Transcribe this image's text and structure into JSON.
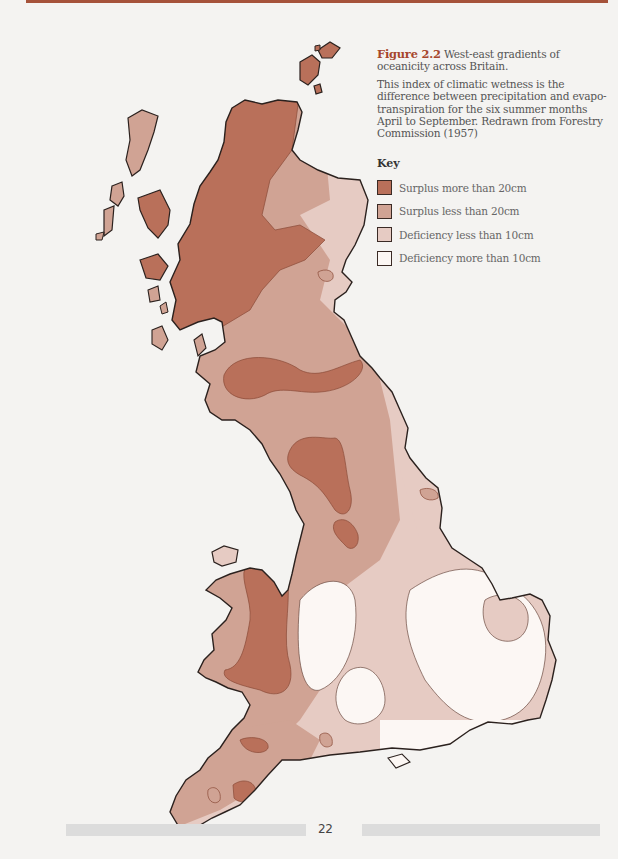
{
  "figure": {
    "label": "Figure 2.2",
    "title": "West-east gradients of oceanicity across Britain.",
    "description": "This index of climatic wetness is the difference between precipitation and evapo-transpiration for the six summer months April to September. Redrawn from Forestry Commission (1957)"
  },
  "key": {
    "title": "Key",
    "items": [
      {
        "label": "Surplus more than 20cm",
        "color": "#b9705a"
      },
      {
        "label": "Surplus less than 20cm",
        "color": "#d0a394"
      },
      {
        "label": "Deficiency less than 10cm",
        "color": "#e6cbc3"
      },
      {
        "label": "Deficiency more than 10cm",
        "color": "#fcf7f4"
      }
    ]
  },
  "colors": {
    "accent": "#a6462c",
    "outline": "#2b211e",
    "footer_bar": "#dcdcdc"
  },
  "footer": {
    "page_number": "22"
  }
}
